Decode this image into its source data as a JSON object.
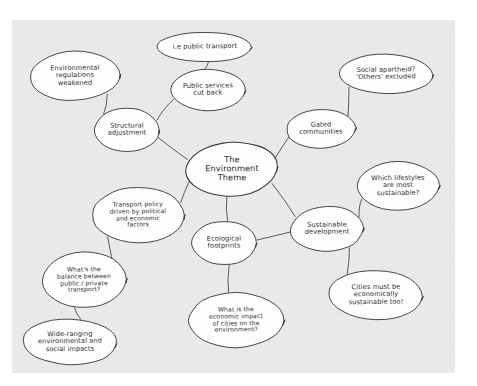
{
  "canvas": {
    "background_color": "#e9e9e9",
    "page_color": "#ffffff",
    "ink_color": "#3d3d3d",
    "bubble_fill": "#fdfdfd"
  },
  "diagram": {
    "type": "mind-map",
    "title": "The Environment Theme",
    "central_node": "central",
    "nodes": [
      {
        "id": "central",
        "label": "The\nEnvironment\nTheme",
        "cx": 232,
        "cy": 169,
        "rx": 47,
        "ry": 27,
        "central": true
      },
      {
        "id": "structural-adjustment",
        "label": "Structural\nadjustment",
        "cx": 127,
        "cy": 130,
        "rx": 33,
        "ry": 22
      },
      {
        "id": "environmental-regulations-weakened",
        "label": "Environmental\nregulations\nweakened",
        "cx": 75,
        "cy": 76,
        "rx": 46,
        "ry": 25
      },
      {
        "id": "public-services-cut-back",
        "label": "Public services\ncut back",
        "cx": 208,
        "cy": 90,
        "rx": 38,
        "ry": 21
      },
      {
        "id": "ie-public-transport",
        "label": "i.e public transport",
        "cx": 205,
        "cy": 47,
        "rx": 48,
        "ry": 15
      },
      {
        "id": "gated-communities",
        "label": "Gated\ncommunities",
        "cx": 321,
        "cy": 129,
        "rx": 35,
        "ry": 20
      },
      {
        "id": "social-apartheid",
        "label": "Social apartheid?\n'Others' excluded",
        "cx": 386,
        "cy": 74,
        "rx": 48,
        "ry": 20
      },
      {
        "id": "sustainable-development",
        "label": "Sustainable\ndevelopment",
        "cx": 327,
        "cy": 229,
        "rx": 37,
        "ry": 23
      },
      {
        "id": "which-lifestyles",
        "label": "Which lifestyles\nare most\nsustainable?",
        "cx": 398,
        "cy": 186,
        "rx": 42,
        "ry": 25
      },
      {
        "id": "cities-economically-sustainable",
        "label": "Cities must be\neconomically\nsustainable too!",
        "cx": 376,
        "cy": 295,
        "rx": 48,
        "ry": 25
      },
      {
        "id": "ecological-footprints",
        "label": "Ecological\nfootprints",
        "cx": 224,
        "cy": 243,
        "rx": 33,
        "ry": 22
      },
      {
        "id": "economic-impact-of-cities",
        "label": "What is the\neconomic impact\nof cities on the\nenvironment?",
        "cx": 236,
        "cy": 320,
        "rx": 48,
        "ry": 28
      },
      {
        "id": "transport-policy",
        "label": "Transport policy\ndriven by political\nand economic\nfactors",
        "cx": 138,
        "cy": 215,
        "rx": 47,
        "ry": 28
      },
      {
        "id": "balance-public-private",
        "label": "What's the\nbalance between\npublic / private\ntransport?",
        "cx": 84,
        "cy": 280,
        "rx": 43,
        "ry": 28
      },
      {
        "id": "wide-ranging-impacts",
        "label": "Wide-ranging\nenvironmental and\nsocial impacts",
        "cx": 70,
        "cy": 342,
        "rx": 48,
        "ry": 23
      }
    ],
    "edges": [
      {
        "from": "central",
        "to": "structural-adjustment"
      },
      {
        "from": "structural-adjustment",
        "to": "environmental-regulations-weakened"
      },
      {
        "from": "structural-adjustment",
        "to": "public-services-cut-back"
      },
      {
        "from": "public-services-cut-back",
        "to": "ie-public-transport"
      },
      {
        "from": "central",
        "to": "gated-communities"
      },
      {
        "from": "gated-communities",
        "to": "social-apartheid"
      },
      {
        "from": "central",
        "to": "sustainable-development"
      },
      {
        "from": "sustainable-development",
        "to": "which-lifestyles"
      },
      {
        "from": "sustainable-development",
        "to": "cities-economically-sustainable"
      },
      {
        "from": "sustainable-development",
        "to": "ecological-footprints"
      },
      {
        "from": "central",
        "to": "ecological-footprints"
      },
      {
        "from": "ecological-footprints",
        "to": "economic-impact-of-cities"
      },
      {
        "from": "central",
        "to": "transport-policy"
      },
      {
        "from": "transport-policy",
        "to": "balance-public-private"
      },
      {
        "from": "balance-public-private",
        "to": "wide-ranging-impacts"
      }
    ]
  }
}
